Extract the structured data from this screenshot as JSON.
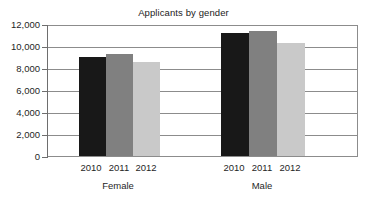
{
  "chart_data": {
    "type": "bar",
    "title": "Applicants by gender",
    "xlabel": "",
    "ylabel": "",
    "ylim": [
      0,
      12000
    ],
    "ytick_labels": [
      "12,000",
      "10,000",
      "8,000",
      "6,000",
      "4,000",
      "2,000",
      "0"
    ],
    "ytick_values": [
      12000,
      10000,
      8000,
      6000,
      4000,
      2000,
      0
    ],
    "grid": true,
    "legend": "none",
    "categories": [
      "Female",
      "Male"
    ],
    "series": [
      {
        "name": "2010",
        "values": [
          9100,
          11400
        ],
        "color": "#181818"
      },
      {
        "name": "2011",
        "values": [
          9400,
          11500
        ],
        "color": "#808080"
      },
      {
        "name": "2012",
        "values": [
          8700,
          10400
        ],
        "color": "#c9c9c9"
      }
    ],
    "groups": [
      {
        "label": "Female",
        "bars": [
          {
            "year": "2010",
            "value": 9100,
            "color": "#181818"
          },
          {
            "year": "2011",
            "value": 9400,
            "color": "#808080"
          },
          {
            "year": "2012",
            "value": 8700,
            "color": "#c9c9c9"
          }
        ]
      },
      {
        "label": "Male",
        "bars": [
          {
            "year": "2010",
            "value": 11400,
            "color": "#181818"
          },
          {
            "year": "2011",
            "value": 11500,
            "color": "#808080"
          },
          {
            "year": "2012",
            "value": 10400,
            "color": "#c9c9c9"
          }
        ]
      }
    ]
  },
  "axis": {
    "tick_0": "12,000",
    "tick_1": "10,000",
    "tick_2": "8,000",
    "tick_3": "6,000",
    "tick_4": "4,000",
    "tick_5": "2,000",
    "tick_6": "0"
  },
  "xaxis": {
    "female_2010": "2010",
    "female_2011": "2011",
    "female_2012": "2012",
    "male_2010": "2010",
    "male_2011": "2011",
    "male_2012": "2012",
    "group_female": "Female",
    "group_male": "Male"
  }
}
